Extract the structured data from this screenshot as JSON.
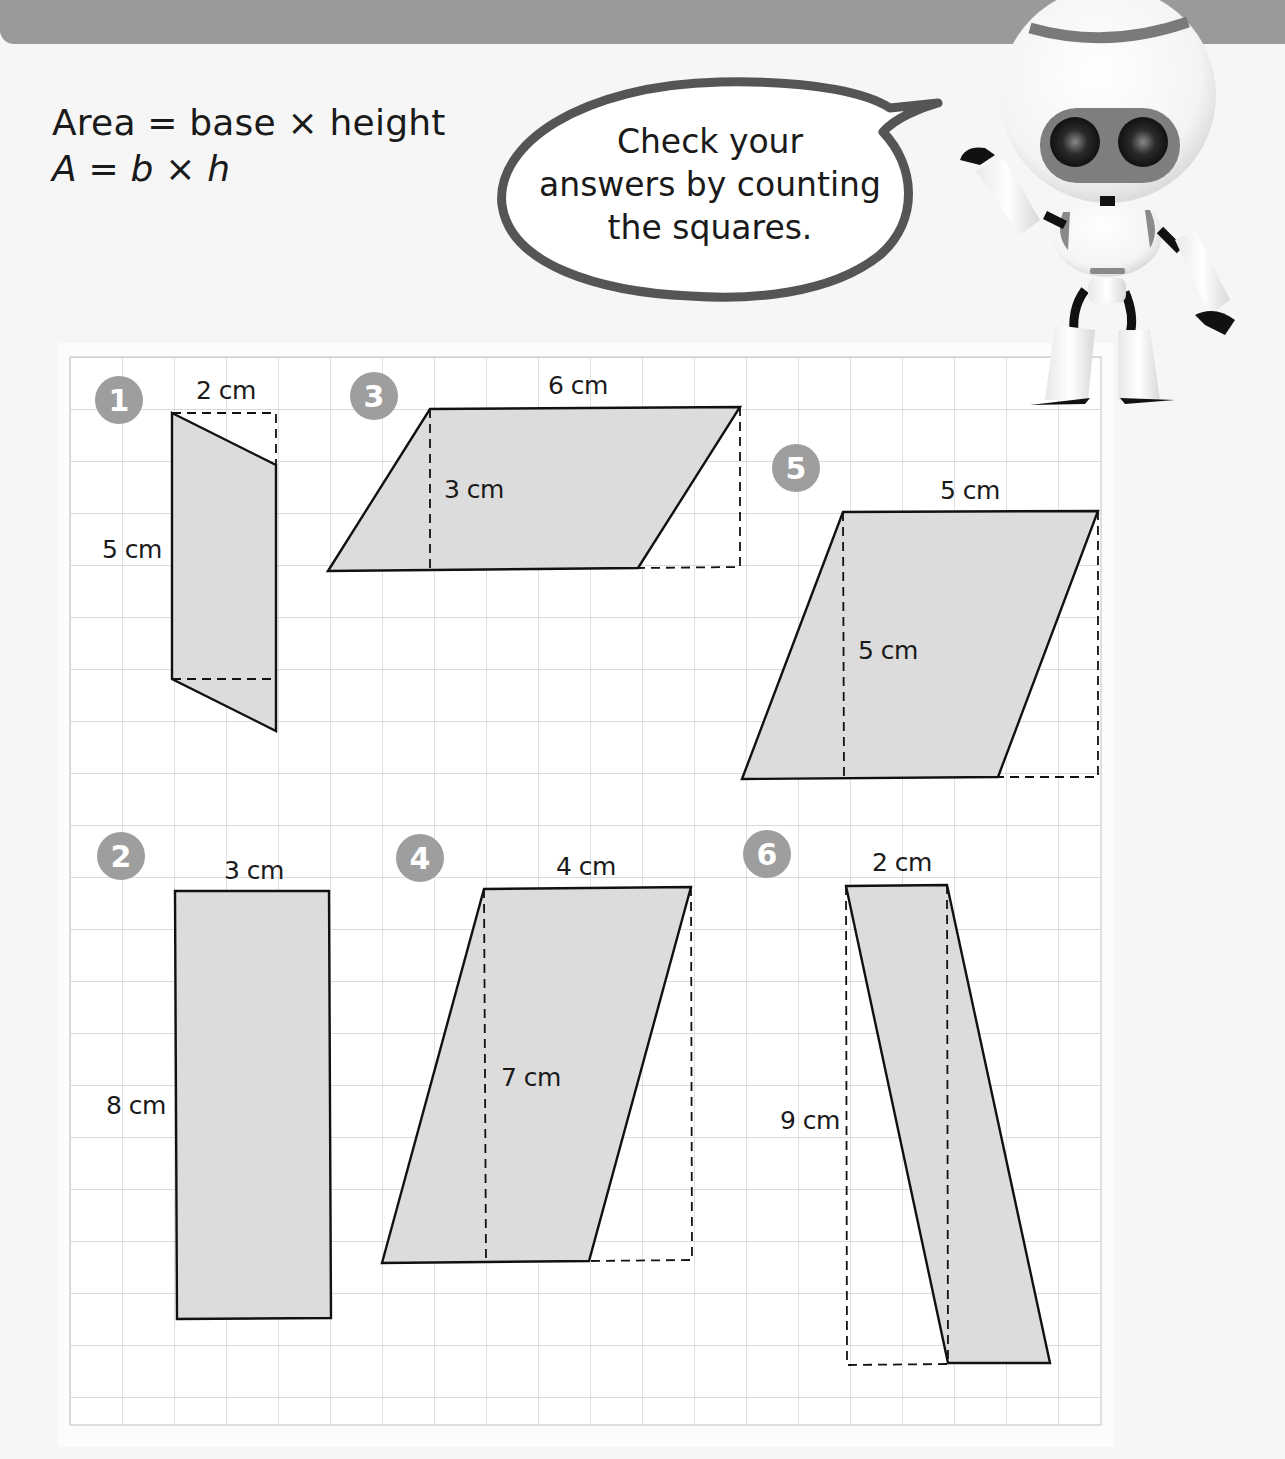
{
  "formula": {
    "line1": "Area = base × height",
    "line2_parts": [
      "A",
      " = ",
      "b",
      " × ",
      "h"
    ]
  },
  "speech_bubble": {
    "lines": [
      "Check your",
      "answers by counting",
      "the squares."
    ]
  },
  "robot": {
    "icon": "robot-mascot-icon"
  },
  "grid": {
    "cell_px": 52,
    "cols": 20,
    "rows": 20
  },
  "colors": {
    "banner": "#9a9a9a",
    "shape_fill": "#dcdcdc",
    "badge": "#9e9e9e",
    "grid_line": "#cfcfcf",
    "outline": "#111111"
  },
  "problems": [
    {
      "number": "1",
      "shape": "parallelogram",
      "base_label": "2 cm",
      "height_label": "5 cm"
    },
    {
      "number": "2",
      "shape": "rectangle",
      "base_label": "3 cm",
      "height_label": "8 cm"
    },
    {
      "number": "3",
      "shape": "parallelogram",
      "base_label": "6 cm",
      "height_label": "3 cm"
    },
    {
      "number": "4",
      "shape": "parallelogram",
      "base_label": "4 cm",
      "height_label": "7 cm"
    },
    {
      "number": "5",
      "shape": "parallelogram",
      "base_label": "5 cm",
      "height_label": "5 cm"
    },
    {
      "number": "6",
      "shape": "parallelogram",
      "base_label": "2 cm",
      "height_label": "9 cm"
    }
  ]
}
